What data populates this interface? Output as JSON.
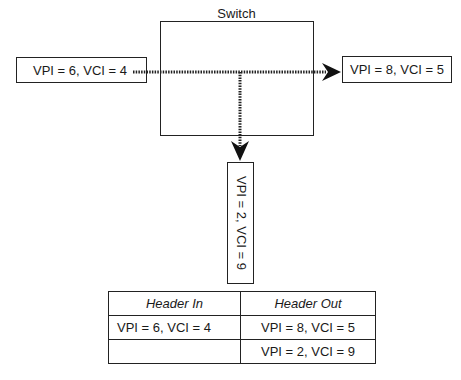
{
  "switch": {
    "title": "Switch"
  },
  "incoming": {
    "label": "VPI = 6, VCI = 4"
  },
  "outgoing": [
    {
      "label": "VPI = 8, VCI = 5",
      "direction": "right"
    },
    {
      "label": "VPI = 2, VCI = 9",
      "direction": "down"
    }
  ],
  "table": {
    "headers": [
      "Header In",
      "Header Out"
    ],
    "rows": [
      [
        "VPI = 6, VCI = 4",
        "VPI = 8,  VCI = 5"
      ],
      [
        "",
        "VPI = 2,  VCI = 9"
      ]
    ]
  }
}
